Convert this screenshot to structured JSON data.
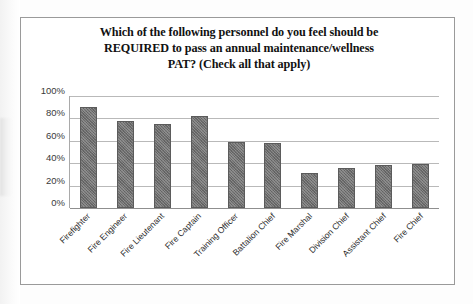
{
  "figure": {
    "frame_border_color": "#9a9a9a",
    "background_color": "#ffffff"
  },
  "chart_data": {
    "type": "bar",
    "title": "Which of the following personnel do you feel should be REQUIRED to pass an annual maintenance/wellness PAT? (Check all that apply)",
    "title_lines": [
      "Which of the following personnel do you feel should be",
      "REQUIRED to pass an annual maintenance/wellness",
      "PAT? (Check all that apply)"
    ],
    "categories": [
      "Firefighter",
      "Fire Engineer",
      "Fire Lieutenant",
      "Fire Captain",
      "Training Officer",
      "Battalion Chief",
      "Fire Marshal",
      "Division Chief",
      "Assistant Chief",
      "Fire Chief"
    ],
    "values": [
      90,
      78,
      75,
      82,
      59,
      58,
      31,
      36,
      38,
      39
    ],
    "value_unit": "%",
    "xlabel": "",
    "ylabel": "",
    "ylim": [
      0,
      100
    ],
    "ytick_values": [
      0,
      20,
      40,
      60,
      80,
      100
    ],
    "ytick_labels": [
      "0%",
      "20%",
      "40%",
      "60%",
      "80%",
      "100%"
    ],
    "grid": true,
    "grid_axis": "y",
    "legend": false,
    "legend_position": "none",
    "bar_fill_color": "#6e6e6e",
    "bar_border_color": "#5b5b5b",
    "gridline_color": "#b9b9b9",
    "tick_label_color": "#3a3a3a",
    "xtick_rotation_degrees": -45
  }
}
